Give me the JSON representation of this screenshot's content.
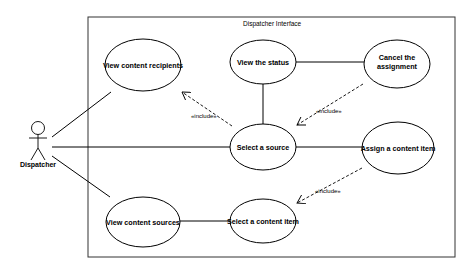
{
  "diagram": {
    "type": "uml-use-case",
    "system": {
      "label": "Dispatcher Interface"
    },
    "actor": {
      "label": "Dispatcher"
    },
    "use_cases": [
      {
        "id": "view_recipients",
        "label_lines": [
          "View content recipients"
        ]
      },
      {
        "id": "view_status",
        "label_lines": [
          "View the status"
        ]
      },
      {
        "id": "cancel_assignment",
        "label_lines": [
          "Cancel the",
          "assignment"
        ]
      },
      {
        "id": "select_source",
        "label_lines": [
          "Select a source"
        ]
      },
      {
        "id": "assign_item",
        "label_lines": [
          "Assign a content item"
        ]
      },
      {
        "id": "view_sources",
        "label_lines": [
          "View content sources"
        ]
      },
      {
        "id": "select_item",
        "label_lines": [
          "Select a content item"
        ]
      }
    ],
    "associations": [
      {
        "from": "Dispatcher",
        "to": "view_recipients"
      },
      {
        "from": "Dispatcher",
        "to": "select_source"
      },
      {
        "from": "Dispatcher",
        "to": "view_sources"
      },
      {
        "from": "view_status",
        "to": "select_source"
      },
      {
        "from": "view_status",
        "to": "cancel_assignment"
      },
      {
        "from": "select_source",
        "to": "assign_item"
      },
      {
        "from": "view_sources",
        "to": "select_item"
      }
    ],
    "includes": [
      {
        "from": "select_source",
        "to": "view_recipients",
        "label": "«include»"
      },
      {
        "from": "cancel_assignment",
        "to": "select_source",
        "label": "«include»"
      },
      {
        "from": "assign_item",
        "to": "select_item",
        "label": "«include»"
      }
    ],
    "labels": {
      "system": "Dispatcher Interface",
      "actor": "Dispatcher",
      "uc_view_recipients": "View content recipients",
      "uc_view_status": "View the status",
      "uc_cancel_line1": "Cancel the",
      "uc_cancel_line2": "assignment",
      "uc_select_source": "Select a source",
      "uc_assign_item": "Assign a content item",
      "uc_view_sources": "View content sources",
      "uc_select_item": "Select a content item",
      "include_1": "«include»",
      "include_2": "«include»",
      "include_3": "«include»"
    }
  }
}
